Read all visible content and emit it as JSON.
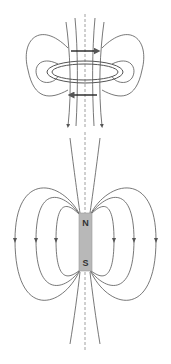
{
  "diagram": {
    "panels": [
      {
        "name": "current-loop",
        "description": "Magnetic field lines around a current-carrying loop",
        "current_arrows": [
          "right (top)",
          "left (bottom)"
        ]
      },
      {
        "name": "bar-magnet",
        "description": "Magnetic field lines around a bar magnet",
        "pole_top": "N",
        "pole_bottom": "S",
        "magnet_color": "#b8b8b8"
      }
    ],
    "colors": {
      "line": "#555555",
      "axis": "#888888",
      "magnet": "#b8b8b8"
    }
  }
}
